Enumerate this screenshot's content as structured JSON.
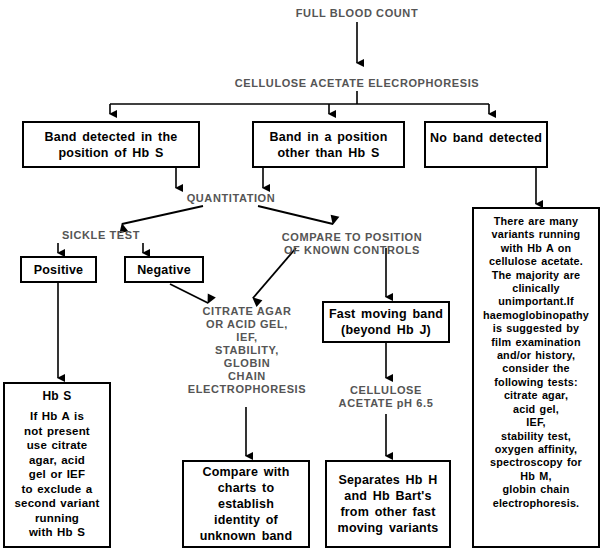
{
  "diagram": {
    "nodes": {
      "full_blood_count": "FULL BLOOD COUNT",
      "cellulose_acetate_electrophoresis": "CELLULOSE ACETATE ELECROPHORESIS",
      "band_hb_s_line1": "Band detected in the",
      "band_hb_s_line2": "position of Hb S",
      "band_other_line1": "Band in a position",
      "band_other_line2": "other than Hb S",
      "no_band": "No band detected",
      "quantitation": "QUANTITATION",
      "sickle_test": "SICKLE TEST",
      "compare_position_line1": "COMPARE TO POSITION",
      "compare_position_line2": "OF KNOWN CONTROLS",
      "positive": "Positive",
      "negative": "Negative",
      "citrate_agar_line1": "CITRATE AGAR",
      "citrate_agar_line2": "OR ACID GEL,",
      "citrate_agar_line3": "IEF,",
      "citrate_agar_line4": "STABILITY,",
      "citrate_agar_line5": "GLOBIN",
      "citrate_agar_line6": "CHAIN",
      "citrate_agar_line7": "ELECTROPHORESIS",
      "fast_moving_line1": "Fast moving band",
      "fast_moving_line2": "(beyond Hb J)",
      "cellulose_ph_line1": "CELLULOSE",
      "cellulose_ph_line2": "ACETATE pH 6.5",
      "hb_s_heading": "Hb S",
      "hb_s_body_line1": "If Hb A is",
      "hb_s_body_line2": "not present",
      "hb_s_body_line3": "use citrate",
      "hb_s_body_line4": "agar, acid",
      "hb_s_body_line5": "gel or IEF",
      "hb_s_body_line6": "to exclude a",
      "hb_s_body_line7": "second variant",
      "hb_s_body_line8": "running",
      "hb_s_body_line9": "with Hb S",
      "compare_charts_line1": "Compare with",
      "compare_charts_line2": "charts to",
      "compare_charts_line3": "establish",
      "compare_charts_line4": "identity of",
      "compare_charts_line5": "unknown band",
      "separates_line1": "Separates Hb H",
      "separates_line2": "and Hb Bart's",
      "separates_line3": "from other fast",
      "separates_line4": "moving variants",
      "variants_line1": "There are many",
      "variants_line2": "variants running",
      "variants_line3": "with Hb A on",
      "variants_line4": "cellulose acetate.",
      "variants_line5": "The majority are",
      "variants_line6": "clinically",
      "variants_line7": "unimportant.If",
      "variants_line8": "haemoglobinopathy",
      "variants_line9": "is suggested by",
      "variants_line10": "film examination",
      "variants_line11": "and/or history,",
      "variants_line12": "consider the",
      "variants_line13": "following tests:",
      "variants_line14": "citrate agar,",
      "variants_line15": "acid gel,",
      "variants_line16": "IEF,",
      "variants_line17": "stability test,",
      "variants_line18": "oxygen affinity,",
      "variants_line19": "spectroscopy for",
      "variants_line20": "Hb M,",
      "variants_line21": "globin chain",
      "variants_line22": "electrophoresis."
    },
    "colors": {
      "stroke": "#000000",
      "background": "#ffffff",
      "caps_text": "#555555",
      "body_text": "#000000"
    }
  }
}
